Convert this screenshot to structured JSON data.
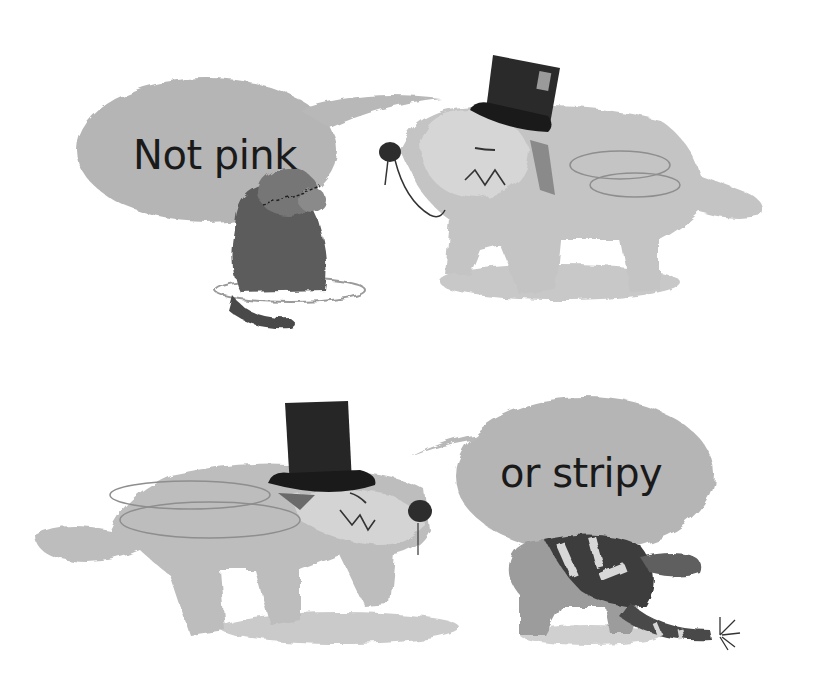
{
  "illustration": {
    "style": "grayscale watercolor and crayon children's book illustration",
    "background_color": "#ffffff",
    "bubble_color": "#b3b3b3",
    "panels": [
      {
        "position": "top",
        "caption": "Not pink",
        "characters": [
          "small dark puppy sitting, looking up",
          "large shaggy dog in top hat with monocle"
        ]
      },
      {
        "position": "bottom",
        "caption": "or stripy",
        "characters": [
          "large shaggy dog in top hat with bow tie, leaning down",
          "small puppy wearing striped sweater with striped tail"
        ]
      }
    ]
  }
}
